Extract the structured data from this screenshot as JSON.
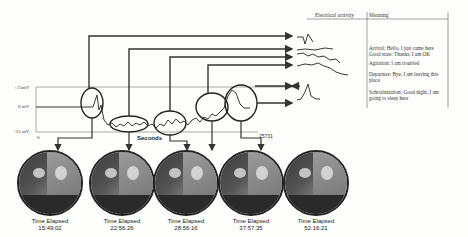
{
  "table": {
    "headers": {
      "electrical_activity": "Electrical activity",
      "meaning": "Meaning"
    },
    "meanings": [
      "Arrival: Hello, I just came here",
      "Good state: Thanks, I am OK",
      "Agitation: I am troubled",
      "Departure: Bye, I am leaving this place",
      "Schrotinization: Good night, I am going to sleep here"
    ]
  },
  "axis": {
    "y_labels": [
      "+15mV",
      "0 mV",
      "-15 mV"
    ],
    "x_start": "0",
    "x_label": "Seconds",
    "x_end": "25731"
  },
  "photos": [
    {
      "label": "Time Elapsed",
      "time": "15:49:02"
    },
    {
      "label": "Time Elapsed",
      "time": "22:56:26"
    },
    {
      "label": "Time Elapsed",
      "time": "28:56:16"
    },
    {
      "label": "Time Elapsed",
      "time": "37:57:35"
    },
    {
      "label": "Time Elapsed",
      "time": "52:16:21"
    }
  ]
}
